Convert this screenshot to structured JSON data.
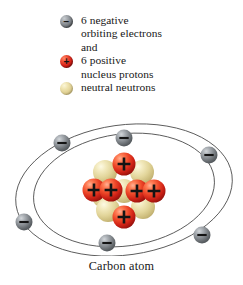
{
  "figure": {
    "caption": "Carbon atom",
    "background_color": "#ffffff"
  },
  "legend": {
    "items": [
      {
        "icon": "electron-sphere-icon",
        "charge_sign": "−",
        "color": "#7d8287",
        "lines": [
          "6 negative",
          "orbiting electrons",
          "and"
        ]
      },
      {
        "icon": "proton-sphere-icon",
        "charge_sign": "+",
        "color": "#d81f16",
        "lines": [
          "6 positive",
          "nucleus protons"
        ]
      },
      {
        "icon": "neutron-sphere-icon",
        "charge_sign": "",
        "color": "#ddcd8e",
        "lines": [
          "neutral neutrons"
        ]
      }
    ],
    "line_0_0": "6 negative",
    "line_0_1": "orbiting electrons",
    "line_0_2": "and",
    "line_1_0": "6 positive",
    "line_1_1": "nucleus protons",
    "line_2_0": "neutral neutrons"
  },
  "diagram": {
    "element_name": "Carbon",
    "electron_count": 6,
    "proton_count": 6,
    "neutron_count": 6,
    "orbit_stroke_color": "#4a4a4a",
    "orbits": [
      {
        "name": "outer-orbit",
        "cx": 124,
        "cy": 86,
        "rx": 109,
        "ry": 65,
        "rotation": -8
      },
      {
        "name": "inner-orbit",
        "cx": 124,
        "cy": 86,
        "rx": 91,
        "ry": 56,
        "rotation": -8
      }
    ],
    "electrons": [
      {
        "name": "electron-outer-upper-left",
        "x": 62,
        "y": 39,
        "r": 8.5
      },
      {
        "name": "electron-inner-top",
        "x": 124,
        "y": 34,
        "r": 8.5
      },
      {
        "name": "electron-outer-right",
        "x": 209,
        "y": 51,
        "r": 8.5
      },
      {
        "name": "electron-outer-left",
        "x": 24,
        "y": 118,
        "r": 8.5
      },
      {
        "name": "electron-inner-bottom",
        "x": 107,
        "y": 139,
        "r": 8.5
      },
      {
        "name": "electron-outer-lower-right",
        "x": 202,
        "y": 131,
        "r": 8.5
      }
    ],
    "neutrons": [
      {
        "name": "neutron-upper-left",
        "x": 105,
        "y": 68,
        "r": 12
      },
      {
        "name": "neutron-upper-right",
        "x": 142,
        "y": 68,
        "r": 12
      },
      {
        "name": "neutron-mid-left",
        "x": 104,
        "y": 92,
        "r": 12
      },
      {
        "name": "neutron-center",
        "x": 124,
        "y": 87,
        "r": 12
      },
      {
        "name": "neutron-lower-left",
        "x": 108,
        "y": 106,
        "r": 12
      },
      {
        "name": "neutron-lower-right",
        "x": 143,
        "y": 103,
        "r": 12
      }
    ],
    "protons": [
      {
        "name": "proton-top",
        "x": 124,
        "y": 60,
        "r": 11.5,
        "sign": "+"
      },
      {
        "name": "proton-left-inner",
        "x": 111,
        "y": 86,
        "r": 11.5,
        "sign": "+"
      },
      {
        "name": "proton-left-outer",
        "x": 94,
        "y": 86,
        "r": 11.5,
        "sign": "+"
      },
      {
        "name": "proton-right-inner",
        "x": 137,
        "y": 87,
        "r": 11.5,
        "sign": "+"
      },
      {
        "name": "proton-right-outer",
        "x": 154,
        "y": 87,
        "r": 11.5,
        "sign": "+"
      },
      {
        "name": "proton-bottom",
        "x": 124,
        "y": 113,
        "r": 11.5,
        "sign": "+"
      }
    ]
  }
}
